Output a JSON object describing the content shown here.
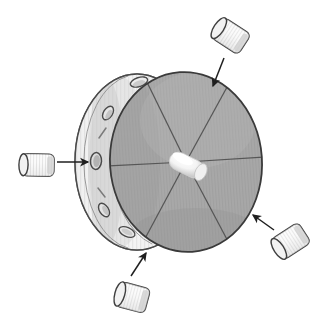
{
  "figure": {
    "background_color": "#ffffff",
    "width": 331,
    "height": 329,
    "style": "patent-line-drawing",
    "alt_text": "A shaded three-dimensional drum seen at an angle, its circular face divided by six radial spoke lines meeting a bright hub at the center. Four small cylindrical pellets sit outside the drum, each with an arrow pointing toward a hole in the drum rim."
  },
  "palette": {
    "outline": "#3a3a3a",
    "outline_soft": "#6b6b6b",
    "face_fill": "#a9a9a9",
    "face_hatch": "#9b9b9b",
    "face_shadow": "#9a9a9a",
    "rim_fill": "#f2f2f2",
    "rim_hatch": "#c9c9c9",
    "rim_shade": "#d8d8d8",
    "back_disc_fill": "#bdbdbd",
    "hole_fill": "#8d8d8d",
    "hole_stroke": "#4a4a4a",
    "hub_fill": "#fbfbfb",
    "hub_shade": "#d9d9d9",
    "cylinder_fill": "#fafafa",
    "cylinder_shade": "#d5d5d5",
    "cylinder_hatch": "#bfbfbf",
    "cylinder_stroke": "#444444",
    "arrow_color": "#1f1f1f",
    "background": "#ffffff"
  },
  "drum": {
    "name": "rotary-drum",
    "face": {
      "label": "drum-face",
      "center_x": 186,
      "center_y": 162,
      "radius_x": 76,
      "radius_y": 90,
      "rotation_deg": -4,
      "fill": "#a9a9a9"
    },
    "back_disc": {
      "label": "drum-back-disc",
      "center_x": 137,
      "center_y": 162,
      "radius_x": 60,
      "radius_y": 88,
      "fill": "#d9d9d9"
    },
    "rim_band": {
      "label": "drum-rim-band",
      "fill": "#f2f2f2",
      "hatch_count": 9
    },
    "hub": {
      "label": "center-hub-cylinder",
      "x": 179,
      "y": 161,
      "length": 36,
      "width": 17,
      "angle_deg": 26,
      "fill": "#fbfbfb"
    },
    "spokes": {
      "label": "radial-spoke-lines",
      "count": 6,
      "angles_deg": [
        0,
        60,
        120,
        180,
        240,
        300
      ],
      "stroke": "#555555"
    },
    "rim_holes": [
      {
        "label": "rim-hole-top",
        "x": 139,
        "y": 82,
        "rx": 9,
        "ry": 4.5,
        "rot": -18
      },
      {
        "label": "rim-hole-upper-left",
        "x": 108,
        "y": 113,
        "rx": 7.5,
        "ry": 4.5,
        "rot": -58
      },
      {
        "label": "rim-hole-left",
        "x": 96,
        "y": 161,
        "rx": 5.5,
        "ry": 8.5,
        "rot": 4
      },
      {
        "label": "rim-hole-lower-left",
        "x": 104,
        "y": 210,
        "rx": 7.5,
        "ry": 4.5,
        "rot": 58
      },
      {
        "label": "rim-hole-bottom",
        "x": 127,
        "y": 232,
        "rx": 8.5,
        "ry": 4.5,
        "rot": 24
      }
    ],
    "rim_marks": [
      {
        "label": "rim-mark-upper",
        "x": 103,
        "y": 133,
        "length": 13,
        "rot": -68
      },
      {
        "label": "rim-mark-lower",
        "x": 100,
        "y": 192,
        "length": 13,
        "rot": 64
      }
    ]
  },
  "inserts": [
    {
      "id": "insert-top-right",
      "name": "cylindrical-insert-top-right",
      "x": 231,
      "y": 36,
      "length": 34,
      "width": 21,
      "angle_deg": 33,
      "arrow": {
        "name": "arrow-top-right",
        "from_x": 224,
        "from_y": 58,
        "to_x": 213,
        "to_y": 86
      }
    },
    {
      "id": "insert-left",
      "name": "cylindrical-insert-left",
      "x": 38,
      "y": 165,
      "length": 32,
      "width": 20,
      "angle_deg": 91,
      "arrow": {
        "name": "arrow-left",
        "from_x": 57,
        "from_y": 162,
        "to_x": 88,
        "to_y": 162
      }
    },
    {
      "id": "insert-bottom-right",
      "name": "cylindrical-insert-bottom-right",
      "x": 291,
      "y": 241,
      "length": 33,
      "width": 21,
      "angle_deg": 124,
      "arrow": {
        "name": "arrow-bottom-right",
        "from_x": 274,
        "from_y": 230,
        "to_x": 253,
        "to_y": 215
      }
    },
    {
      "id": "insert-bottom",
      "name": "cylindrical-insert-bottom",
      "x": 133,
      "y": 297,
      "length": 34,
      "width": 21,
      "angle_deg": 14,
      "arrow": {
        "name": "arrow-bottom",
        "from_x": 131,
        "from_y": 276,
        "to_x": 146,
        "to_y": 253
      }
    }
  ]
}
